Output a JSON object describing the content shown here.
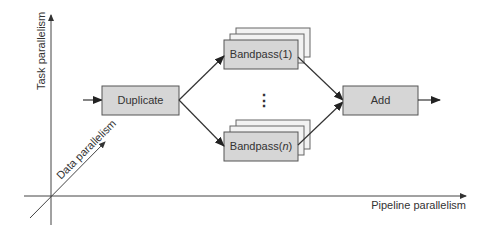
{
  "axes": {
    "task": "Task parallelism",
    "data": "Data parallelism",
    "pipeline": "Pipeline parallelism"
  },
  "nodes": {
    "duplicate": "Duplicate",
    "bandpass_first_prefix": "Bandpass(",
    "bandpass_first_index": "1",
    "bandpass_first_suffix": ")",
    "bandpass_last_prefix": "Bandpass(",
    "bandpass_last_index": "n",
    "bandpass_last_suffix": ")",
    "ellipsis": "⋮",
    "add": "Add"
  },
  "colors": {
    "box_fill": "#d6d6d6",
    "box_back_fill": "#f2f2f2",
    "stroke": "#333333"
  }
}
